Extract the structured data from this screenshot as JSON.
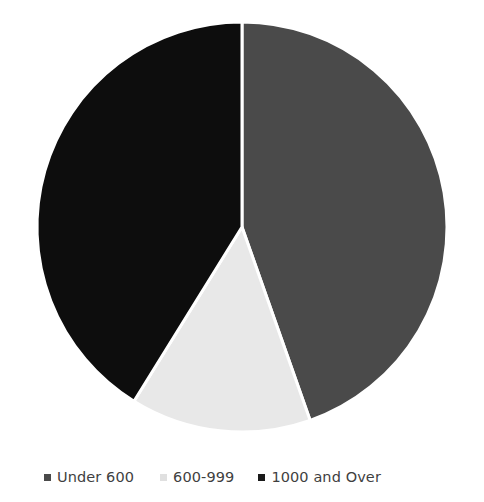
{
  "chart_data": {
    "type": "pie",
    "title": "",
    "categories": [
      "Under 600",
      "600-999",
      "1000 and Over"
    ],
    "values": [
      44.6,
      14.2,
      41.2
    ],
    "units": "percent",
    "start_angle_deg": 0,
    "direction": "clockwise",
    "slice_boundaries_deg": [
      0,
      160.6,
      211.8,
      360
    ],
    "colors": [
      "#4a4a4a",
      "#e8e8e8",
      "#0d0d0d"
    ],
    "slice_border_color": "#ffffff",
    "slice_border_width": 3,
    "legend_position": "bottom",
    "grid": false,
    "xlabel": "",
    "ylabel": "",
    "background": "#ffffff"
  },
  "legend": {
    "items": [
      {
        "label": "Under 600",
        "color": "#4a4a4a"
      },
      {
        "label": "600-999",
        "color": "#e0e0e0"
      },
      {
        "label": "1000 and Over",
        "color": "#1a1a1a"
      }
    ]
  },
  "pie": {
    "center_x": 242,
    "center_y": 227,
    "radius": 205
  }
}
